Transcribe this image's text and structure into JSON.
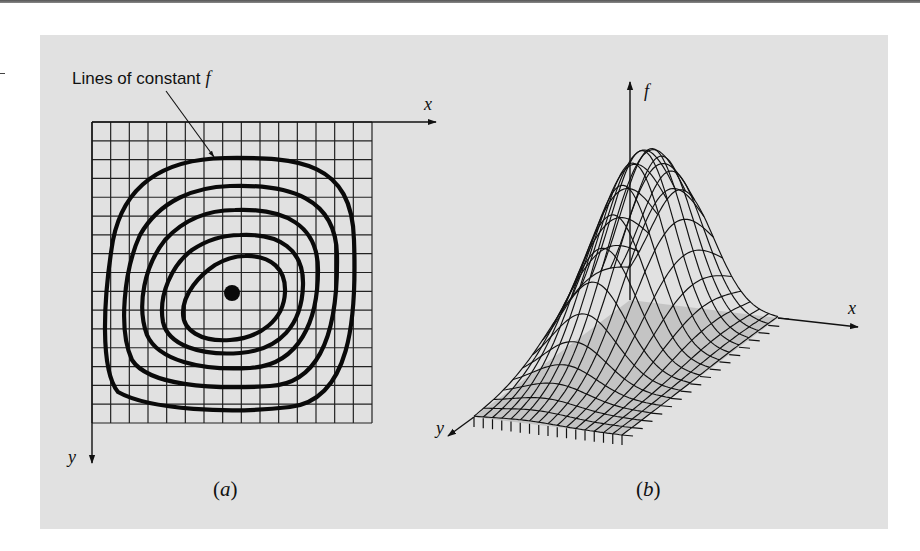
{
  "figure": {
    "panel_a": {
      "callout_label": "Lines of constant",
      "callout_var": "f",
      "x_axis_label": "x",
      "y_axis_label": "y",
      "caption_open": "(",
      "caption_letter": "a",
      "caption_close": ")",
      "grid": {
        "columns": 15,
        "rows": 16
      },
      "contour_count": 5,
      "optimum_marker": "filled-dot"
    },
    "panel_b": {
      "f_axis_label": "f",
      "x_axis_label": "x",
      "y_axis_label": "y",
      "caption_open": "(",
      "caption_letter": "b",
      "caption_close": ")",
      "surface": "wireframe-peak"
    }
  },
  "colors": {
    "panel_bg": "#e1e1e1",
    "base_shade": "#c4c4c4",
    "ink": "#111111"
  }
}
